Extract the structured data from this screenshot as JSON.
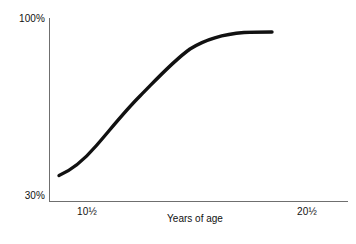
{
  "chart_data": {
    "type": "line",
    "title": "",
    "subtitle": "",
    "xlabel": "Years of age",
    "ylabel": "",
    "grid": false,
    "legend": false,
    "legend_position": "none",
    "xlim": [
      9.3,
      24.6
    ],
    "ylim": [
      30,
      100
    ],
    "x_tick_labels": [
      "10½",
      "20½"
    ],
    "x_tick_values": [
      10.5,
      20.5
    ],
    "y_tick_labels": [
      "30%",
      "100%"
    ],
    "y_tick_values": [
      30,
      100
    ],
    "series": [
      {
        "name": "Growth curve",
        "color": "#111111",
        "x": [
          9.8,
          10.5,
          11.2,
          12.0,
          12.8,
          13.6,
          14.4,
          15.2,
          16.0,
          16.8,
          17.6,
          18.4,
          19.2,
          19.8
        ],
        "values": [
          40.0,
          43.5,
          48.0,
          54.0,
          60.5,
          67.5,
          74.0,
          80.0,
          85.0,
          89.0,
          92.0,
          94.0,
          95.2,
          95.6
        ]
      }
    ],
    "annotations": []
  },
  "axes": {
    "y_top_label": "100%",
    "y_bottom_label": "30%",
    "x_left_label": "10½",
    "x_right_label": "20½",
    "x_axis_title": "Years of age"
  },
  "colors": {
    "background": "#ffffff",
    "axis": "#6f6f6f",
    "curve": "#111111",
    "text": "#111111"
  },
  "curve_geometry": {
    "path": "M 59,175.5 C 72,170 84,160 96,146 C 110,130 124,112 140,96 C 156,80 172,62 190,49 C 206,39 224,34 244,32.5 C 254,32 264,32 272,32"
  }
}
